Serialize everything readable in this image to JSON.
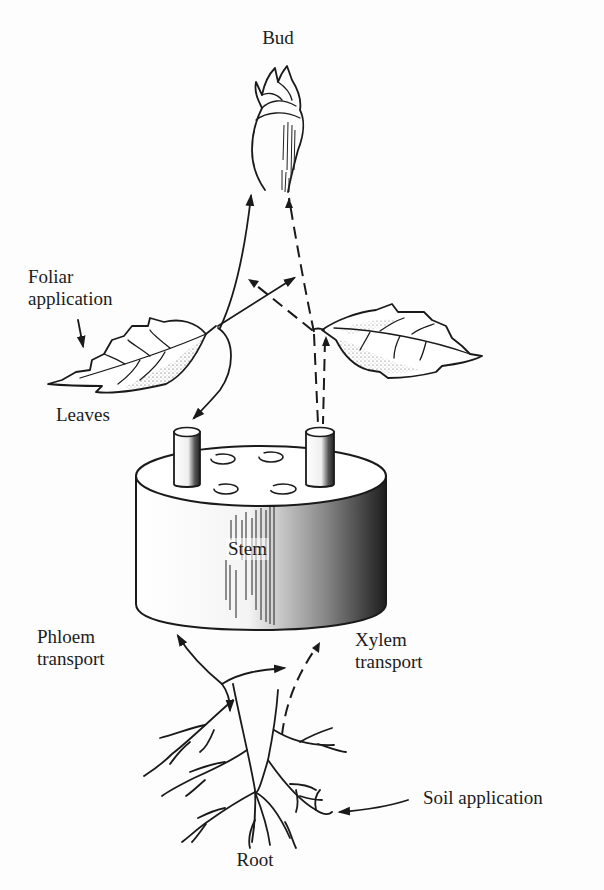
{
  "diagram": {
    "type": "plant-systemic-transport-illustration",
    "labels": {
      "bud": "Bud",
      "foliar_application_line1": "Foliar",
      "foliar_application_line2": "application",
      "leaves": "Leaves",
      "stem": "Stem",
      "phloem_line1": "Phloem",
      "phloem_line2": "transport",
      "xylem_line1": "Xylem",
      "xylem_line2": "transport",
      "soil_application": "Soil application",
      "root": "Root"
    },
    "legend_semantics": {
      "solid_arrows": "phloem transport",
      "dashed_arrows": "xylem transport"
    },
    "colors": {
      "ink": "#1a1a1a",
      "paper": "#fdfdfd"
    }
  }
}
